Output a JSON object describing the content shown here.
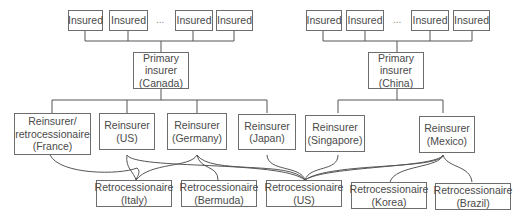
{
  "left_tree": {
    "insured": [
      "Insured",
      "Insured",
      "Insured",
      "Insured"
    ],
    "ellipsis": "...",
    "primary": "Primary\ninsurer\n(Canada)",
    "reinsurers": [
      "Reinsurer/\nretrocessionaire\n(France)",
      "Reinsurer\n(US)",
      "Reinsurer\n(Germany)",
      "Reinsurer\n(Japan)"
    ]
  },
  "right_tree": {
    "insured": [
      "Insured",
      "Insured",
      "Insured",
      "Insured"
    ],
    "ellipsis": "...",
    "primary": "Primary\ninsurer\n(China)",
    "reinsurers": [
      "Reinsurer\n(Singapore)",
      "Reinsurer\n(Mexico)"
    ]
  },
  "retrocessionaires": [
    "Retrocessionaire\n(Italy)",
    "Retrocessionaire\n(Bermuda)",
    "Retrocessionaire\n(US)",
    "Retrocessionaire\n(Korea)",
    "Retrocessionaire\n(Brazil)"
  ],
  "colors": {
    "line": "#555555",
    "border": "#6d6d6d",
    "text": "#4a4a4a"
  }
}
